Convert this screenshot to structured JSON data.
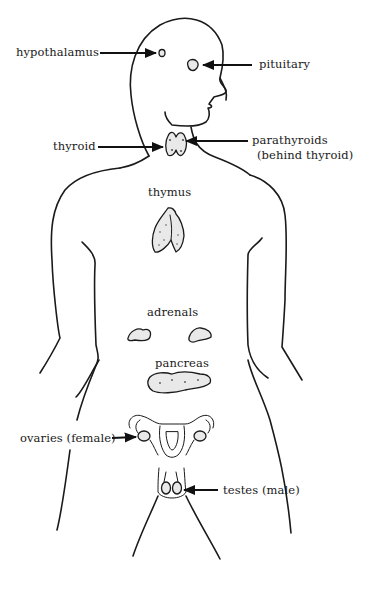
{
  "diagram": {
    "labels": {
      "hypothalamus": "hypothalamus",
      "pituitary": "pituitary",
      "thyroid": "thyroid",
      "parathyroids": "parathyroids",
      "parathyroids_note": "(behind thyroid)",
      "thymus": "thymus",
      "adrenals": "adrenals",
      "pancreas": "pancreas",
      "ovaries": "ovaries (female)",
      "testes": "testes (male)"
    },
    "colors": {
      "line": "#1a1a1a",
      "background": "#ffffff",
      "gland_fill": "#e9e9e9"
    }
  }
}
